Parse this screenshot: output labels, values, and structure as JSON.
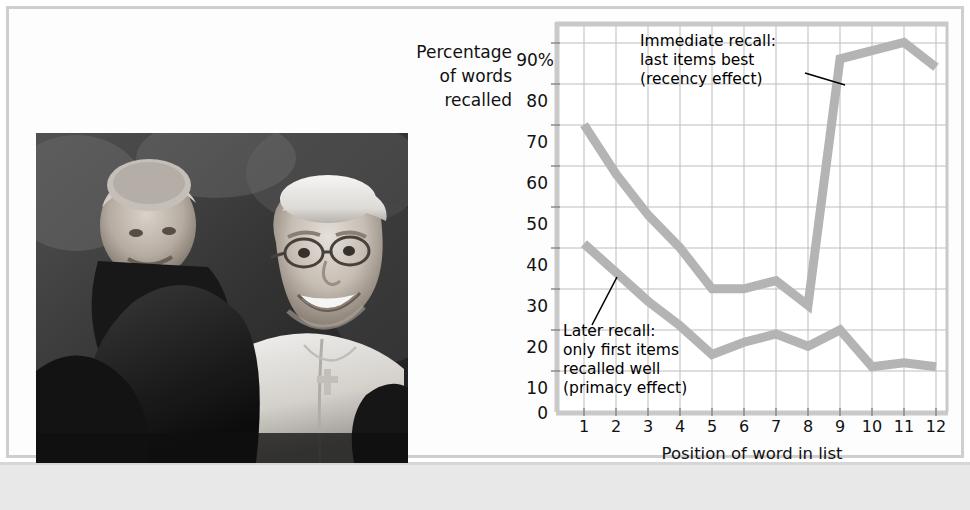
{
  "figure": {
    "credit": "Vincenzo Pinto/AFP/Getty Images",
    "photo_alt": "pope-francis-crowd-photo"
  },
  "chart_data": {
    "type": "line",
    "title": "",
    "xlabel": "Position of word in list",
    "ylabel": "Percentage of words recalled",
    "ylabel_lines": [
      "Percentage",
      "of words",
      "recalled"
    ],
    "categories": [
      "1",
      "2",
      "3",
      "4",
      "5",
      "6",
      "7",
      "8",
      "9",
      "10",
      "11",
      "12"
    ],
    "x": [
      1,
      2,
      3,
      4,
      5,
      6,
      7,
      8,
      9,
      10,
      11,
      12
    ],
    "xlim": [
      0.5,
      12.5
    ],
    "ylim": [
      0,
      95
    ],
    "yticks": [
      0,
      10,
      20,
      30,
      40,
      50,
      60,
      70,
      80,
      90
    ],
    "ytick_labels": [
      "0",
      "10",
      "20",
      "30",
      "40",
      "50",
      "60",
      "70",
      "80",
      "90%"
    ],
    "grid": true,
    "legend": "none",
    "series": [
      {
        "name": "Immediate recall",
        "color": "#b4b4b4",
        "values": [
          70,
          58,
          48,
          40,
          30,
          30,
          32,
          26,
          86,
          88,
          90,
          84
        ]
      },
      {
        "name": "Later recall",
        "color": "#b4b4b4",
        "values": [
          41,
          34,
          27,
          21,
          14,
          17,
          19,
          16,
          20,
          11,
          12,
          11
        ]
      }
    ],
    "annotations": [
      {
        "id": "immediate",
        "text": "Immediate recall:\nlast items best\n(recency effect)",
        "points_to": "series-immediate-position-9"
      },
      {
        "id": "later",
        "text": "Later recall:\nonly first items\nrecalled well\n(primacy effect)",
        "points_to": "series-later-position-2"
      }
    ]
  }
}
